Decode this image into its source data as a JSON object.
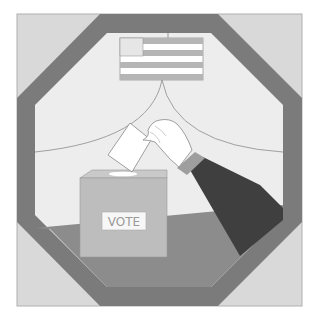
{
  "illustration": {
    "title": "Ballot box voting illustration",
    "ballot_box": {
      "label": "VOTE"
    },
    "icons": {
      "flag": "american-flag-icon",
      "ballot": "ballot-paper-icon",
      "hand": "hand-icon",
      "box": "ballot-box-icon"
    },
    "colors": {
      "background": "#ffffff",
      "outer_square": "#d9d9d9",
      "octagon_frame": "#7b7b7b",
      "interior": "#ededed",
      "floor": "#8c8c8c",
      "box_front": "#bdbdbd",
      "box_top": "#c9c9c9",
      "label_bg": "#f7f7f7",
      "sleeve": "#3f3f3f",
      "cuff": "#9e9e9e",
      "flag_stripe": "#b5b5b5",
      "curtain_line": "#a0a0a0"
    }
  }
}
